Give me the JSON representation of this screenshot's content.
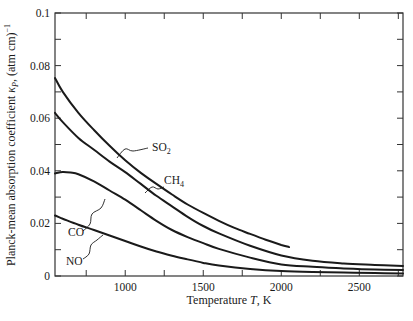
{
  "chart_data": {
    "type": "line",
    "title": "",
    "xlabel": "Temperature T, K",
    "xlabel_parts": {
      "pre": "Temperature ",
      "italic": "T",
      "post": ", K"
    },
    "ylabel": "Planck-mean absorption coefficient κP, (atm cm)⁻¹",
    "ylabel_parts": {
      "pre": "Planck-mean absorption coefficient ",
      "kappa": "κ",
      "sub": "P",
      "post": ", (atm cm)",
      "sup": "−1"
    },
    "xlim": [
      550,
      2780
    ],
    "ylim": [
      0,
      0.1
    ],
    "xticks_major": [
      1000,
      1500,
      2000,
      2500
    ],
    "xticks_minor": [
      750,
      1250,
      1750,
      2250,
      2750
    ],
    "yticks_major": [
      0,
      0.02,
      0.04,
      0.06,
      0.08,
      0.1
    ],
    "yticks_minor": [
      0.01,
      0.03,
      0.05,
      0.07,
      0.09
    ],
    "ytick_labels": [
      "0",
      "0.02",
      "0.04",
      "0.06",
      "0.08",
      "0.1"
    ],
    "xtick_labels": [
      "1000",
      "1500",
      "2000",
      "2500"
    ],
    "grid": false,
    "legend": "inline labels with leader lines",
    "series": [
      {
        "name": "SO2",
        "label_main": "SO",
        "label_sub": "2",
        "x": [
          550,
          600,
          700,
          800,
          900,
          1000,
          1100,
          1200,
          1300,
          1400,
          1500,
          1600,
          1700,
          1800,
          1900,
          2000,
          2050
        ],
        "values": [
          0.0753,
          0.07,
          0.062,
          0.0555,
          0.0495,
          0.044,
          0.0392,
          0.035,
          0.031,
          0.0272,
          0.024,
          0.021,
          0.0183,
          0.016,
          0.0138,
          0.0118,
          0.011
        ],
        "label_pos": {
          "x": 152,
          "y": 151
        },
        "leader": [
          [
            117,
            158
          ],
          [
            125,
            149
          ],
          [
            133,
            151
          ],
          [
            148,
            148
          ]
        ]
      },
      {
        "name": "CH4",
        "label_main": "CH",
        "label_sub": "4",
        "x": [
          550,
          600,
          700,
          800,
          900,
          1000,
          1100,
          1200,
          1300,
          1400,
          1500,
          1600,
          1800,
          2000,
          2200,
          2400,
          2600,
          2780
        ],
        "values": [
          0.062,
          0.0585,
          0.0525,
          0.048,
          0.0435,
          0.0395,
          0.035,
          0.0305,
          0.0265,
          0.0225,
          0.019,
          0.0162,
          0.0115,
          0.0078,
          0.0058,
          0.0048,
          0.0042,
          0.0038
        ],
        "label_pos": {
          "x": 164,
          "y": 184
        },
        "leader": [
          [
            145,
            193
          ],
          [
            152,
            187
          ],
          [
            158,
            189
          ],
          [
            164,
            187
          ]
        ]
      },
      {
        "name": "CO",
        "label_main": "CO",
        "label_sub": "",
        "x": [
          550,
          600,
          650,
          700,
          800,
          900,
          1000,
          1100,
          1200,
          1300,
          1400,
          1500,
          1600,
          1800,
          2000,
          2200,
          2400,
          2600,
          2780
        ],
        "values": [
          0.039,
          0.0395,
          0.0393,
          0.0387,
          0.036,
          0.0325,
          0.029,
          0.025,
          0.021,
          0.0175,
          0.0148,
          0.0125,
          0.0103,
          0.007,
          0.0044,
          0.0035,
          0.0029,
          0.0025,
          0.0023
        ],
        "label_pos": {
          "x": 68,
          "y": 236
        },
        "leader": [
          [
            83,
            231
          ],
          [
            90,
            224
          ],
          [
            92,
            214
          ],
          [
            101,
            208
          ],
          [
            105,
            199
          ]
        ]
      },
      {
        "name": "NO",
        "label_main": "NO",
        "label_sub": "",
        "x": [
          550,
          600,
          700,
          800,
          900,
          1000,
          1100,
          1200,
          1300,
          1400,
          1500,
          1600,
          1800,
          2000,
          2200,
          2400,
          2600,
          2780
        ],
        "values": [
          0.023,
          0.0218,
          0.0195,
          0.0175,
          0.0154,
          0.0133,
          0.0112,
          0.0093,
          0.0077,
          0.0063,
          0.005,
          0.004,
          0.0027,
          0.0019,
          0.0015,
          0.0013,
          0.0011,
          0.001
        ],
        "label_pos": {
          "x": 66,
          "y": 265
        },
        "leader": [
          [
            83,
            259
          ],
          [
            89,
            254
          ],
          [
            91,
            245
          ],
          [
            97,
            240
          ],
          [
            103,
            235
          ]
        ]
      }
    ]
  },
  "plot_area": {
    "left": 55,
    "right": 403,
    "top": 13,
    "bottom": 276
  },
  "colors": {
    "line": "#1a1a1a",
    "axis": "#333333",
    "background": "#ffffff"
  }
}
